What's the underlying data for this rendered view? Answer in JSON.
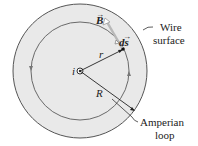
{
  "diagram": {
    "labels": {
      "current": "i",
      "radius_r": "r",
      "radius_R": "R",
      "field": "B",
      "element": "ds",
      "wire_surface_line1": "Wire",
      "wire_surface_line2": "surface",
      "amperian_line1": "Amperian",
      "amperian_line2": "loop"
    },
    "colors": {
      "wire_fill": "#e8e8e8",
      "outline": "#555555",
      "b_vector": "#b8b8b8"
    }
  }
}
